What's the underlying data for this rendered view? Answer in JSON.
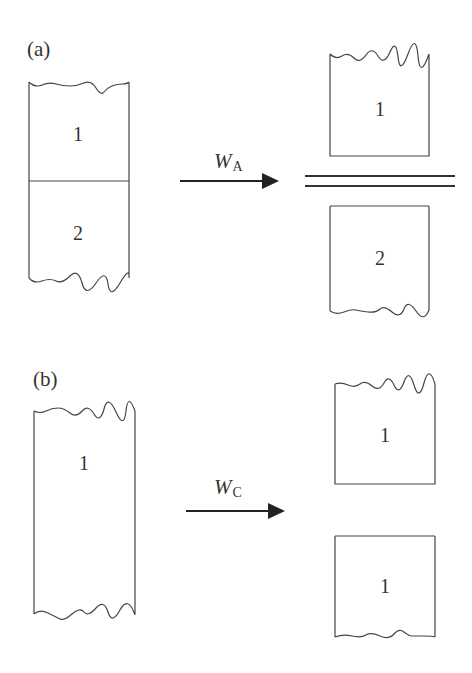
{
  "figure": {
    "panel_a": {
      "label": "(a)",
      "before": {
        "blocks": [
          "1",
          "2"
        ]
      },
      "arrow": {
        "symbol": "W",
        "subscript": "A"
      },
      "after": {
        "blocks": [
          "1",
          "2"
        ],
        "separator": "double-line"
      }
    },
    "panel_b": {
      "label": "(b)",
      "before": {
        "blocks": [
          "1"
        ]
      },
      "arrow": {
        "symbol": "W",
        "subscript": "C"
      },
      "after": {
        "blocks": [
          "1",
          "1"
        ]
      }
    }
  },
  "colors": {
    "line": "#444444",
    "arrow": "#222222",
    "text": "#333333",
    "background": "#ffffff"
  }
}
